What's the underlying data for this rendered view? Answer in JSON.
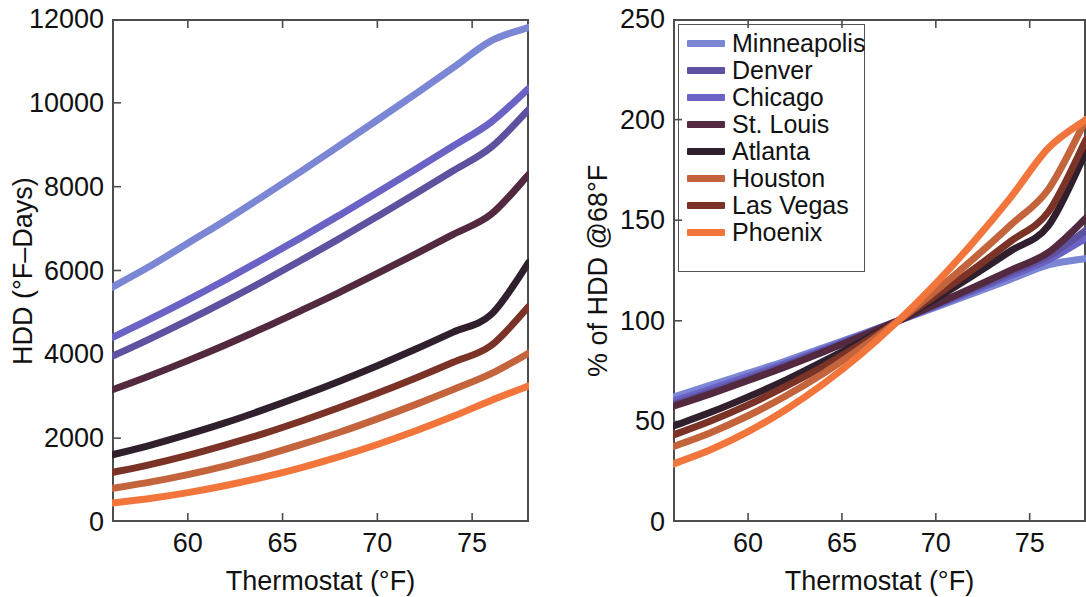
{
  "figure": {
    "panels": [
      "hdd-absolute",
      "hdd-percent"
    ]
  },
  "legend": {
    "position": "top-left-inside-right-panel",
    "entries": [
      {
        "label": "Minneapolis",
        "color": "#7b86d4"
      },
      {
        "label": "Denver",
        "color": "#5e51a0"
      },
      {
        "label": "Chicago",
        "color": "#6a62c4"
      },
      {
        "label": "St. Louis",
        "color": "#53293f"
      },
      {
        "label": "Atlanta",
        "color": "#30202e"
      },
      {
        "label": "Houston",
        "color": "#c4643c"
      },
      {
        "label": "Las Vegas",
        "color": "#7a3326"
      },
      {
        "label": "Phoenix",
        "color": "#f2763c"
      }
    ]
  },
  "chart_data": [
    {
      "id": "hdd-absolute",
      "type": "line",
      "title": "",
      "xlabel": "Thermostat (°F)",
      "ylabel": "HDD (°F–Days)",
      "xlim": [
        56,
        78
      ],
      "ylim": [
        0,
        12000
      ],
      "xticks": [
        60,
        65,
        70,
        75
      ],
      "xtick_labels": [
        "60",
        "65",
        "70",
        "75"
      ],
      "yticks": [
        0,
        2000,
        4000,
        6000,
        8000,
        10000,
        12000
      ],
      "ytick_labels": [
        "0",
        "2000",
        "4000",
        "6000",
        "8000",
        "10000",
        "12000"
      ],
      "grid": false,
      "x": [
        56,
        58,
        60,
        62,
        64,
        66,
        68,
        70,
        72,
        74,
        76,
        78
      ],
      "series": [
        {
          "name": "Minneapolis",
          "color": "#7b86d4",
          "values": [
            5600,
            6100,
            6650,
            7200,
            7780,
            8370,
            8980,
            9590,
            10210,
            10840,
            11480,
            11800
          ]
        },
        {
          "name": "Chicago",
          "color": "#6a62c4",
          "values": [
            4400,
            4840,
            5300,
            5780,
            6280,
            6790,
            7320,
            7860,
            8410,
            8970,
            9540,
            10350
          ]
        },
        {
          "name": "Denver",
          "color": "#5e51a0",
          "values": [
            3950,
            4370,
            4810,
            5270,
            5750,
            6250,
            6760,
            7290,
            7830,
            8380,
            8940,
            9850
          ]
        },
        {
          "name": "St. Louis",
          "color": "#53293f",
          "values": [
            3150,
            3490,
            3850,
            4230,
            4630,
            5050,
            5480,
            5930,
            6390,
            6860,
            7340,
            8300
          ]
        },
        {
          "name": "Atlanta",
          "color": "#30202e",
          "values": [
            1600,
            1830,
            2090,
            2370,
            2680,
            3010,
            3360,
            3730,
            4120,
            4530,
            4950,
            6200
          ]
        },
        {
          "name": "Las Vegas",
          "color": "#7a3326",
          "values": [
            1180,
            1370,
            1590,
            1840,
            2110,
            2410,
            2730,
            3070,
            3430,
            3810,
            4210,
            5150
          ]
        },
        {
          "name": "Houston",
          "color": "#c4643c",
          "values": [
            800,
            950,
            1130,
            1340,
            1580,
            1850,
            2140,
            2460,
            2800,
            3160,
            3540,
            4030
          ]
        },
        {
          "name": "Phoenix",
          "color": "#f2763c",
          "values": [
            450,
            560,
            700,
            870,
            1070,
            1300,
            1560,
            1850,
            2170,
            2520,
            2900,
            3250
          ]
        }
      ]
    },
    {
      "id": "hdd-percent",
      "type": "line",
      "title": "",
      "xlabel": "Thermostat (°F)",
      "ylabel": "% of HDD @68°F",
      "xlim": [
        56,
        78
      ],
      "ylim": [
        0,
        250
      ],
      "xticks": [
        60,
        65,
        70,
        75
      ],
      "xtick_labels": [
        "60",
        "65",
        "70",
        "75"
      ],
      "yticks": [
        0,
        50,
        100,
        150,
        200,
        250
      ],
      "ytick_labels": [
        "0",
        "50",
        "100",
        "150",
        "200",
        "250"
      ],
      "grid": false,
      "crossing_point": {
        "x": 68,
        "y": 100
      },
      "x": [
        56,
        58,
        60,
        62,
        64,
        66,
        68,
        70,
        72,
        74,
        76,
        78
      ],
      "series": [
        {
          "name": "Minneapolis",
          "color": "#7b86d4",
          "values": [
            62,
            68,
            74,
            80,
            86.6,
            93.2,
            100,
            106.8,
            113.7,
            120.7,
            127.8,
            131
          ]
        },
        {
          "name": "Chicago",
          "color": "#6a62c4",
          "values": [
            60,
            66.1,
            72.4,
            78.9,
            85.8,
            92.8,
            100,
            107.4,
            114.9,
            122.5,
            130.3,
            141
          ]
        },
        {
          "name": "Denver",
          "color": "#5e51a0",
          "values": [
            58.4,
            64.6,
            71.1,
            77.9,
            85,
            92.4,
            100,
            107.8,
            115.8,
            123.9,
            132.2,
            145
          ]
        },
        {
          "name": "St. Louis",
          "color": "#53293f",
          "values": [
            57.5,
            63.7,
            70.3,
            77.2,
            84.5,
            92.2,
            100,
            108.2,
            116.6,
            125.2,
            134,
            151
          ]
        },
        {
          "name": "Atlanta",
          "color": "#30202e",
          "values": [
            47.6,
            54.5,
            62.2,
            70.5,
            79.8,
            89.6,
            100,
            111,
            122.6,
            134.8,
            147.3,
            184
          ]
        },
        {
          "name": "Las Vegas",
          "color": "#7a3326",
          "values": [
            43.2,
            50.2,
            58.2,
            67.4,
            77.3,
            88.3,
            100,
            112.5,
            125.6,
            139.6,
            154.2,
            190
          ]
        },
        {
          "name": "Houston",
          "color": "#c4643c",
          "values": [
            37.4,
            44.4,
            52.8,
            62.6,
            73.8,
            86.4,
            100,
            114.9,
            130.8,
            147.7,
            165.4,
            200
          ]
        },
        {
          "name": "Phoenix",
          "color": "#f2763c",
          "values": [
            28.8,
            35.9,
            44.9,
            55.8,
            68.6,
            83.3,
            100,
            118.6,
            139.1,
            161.5,
            185.9,
            200
          ]
        }
      ]
    }
  ]
}
